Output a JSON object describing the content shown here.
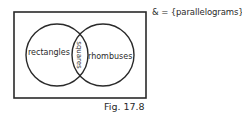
{
  "diagram": {
    "type": "venn",
    "universal_set": {
      "symbol": "&",
      "label": "= {parallelograms}"
    },
    "sets": [
      {
        "id": "left",
        "label": "rectangles"
      },
      {
        "id": "right",
        "label": "rhombuses"
      }
    ],
    "intersection": {
      "label": "squares"
    },
    "caption": "Fig. 17.8",
    "colors": {
      "stroke": "#2a2a2a",
      "text": "#2a2a2a",
      "background": "#ffffff"
    }
  }
}
